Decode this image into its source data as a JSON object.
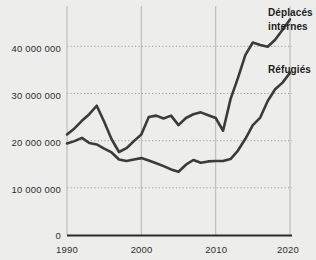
{
  "chart_data": {
    "type": "line",
    "title": "",
    "xlabel": "",
    "ylabel": "",
    "xlim": [
      1990,
      2020
    ],
    "ylim": [
      0,
      46000000
    ],
    "grid": "horizontal-dotted-and-vertical-solid",
    "legend_position": "right-inline-labels",
    "xticks": [
      "1990",
      "2000",
      "2010",
      "2020"
    ],
    "xtick_values": [
      1990,
      2000,
      2010,
      2020
    ],
    "yticks": [
      "0",
      "10 000 000",
      "20 000 000",
      "30 000 000",
      "40 000 000"
    ],
    "ytick_values": [
      0,
      10000000,
      20000000,
      30000000,
      40000000
    ],
    "x": [
      1990,
      1991,
      1992,
      1993,
      1994,
      1995,
      1996,
      1997,
      1998,
      1999,
      2000,
      2001,
      2002,
      2003,
      2004,
      2005,
      2006,
      2007,
      2008,
      2009,
      2010,
      2011,
      2012,
      2013,
      2014,
      2015,
      2016,
      2017,
      2018,
      2019,
      2020
    ],
    "series": [
      {
        "name": "Déplacés internes",
        "label_lines": [
          "Déplacés",
          "internes"
        ],
        "color": "#3b3b3b",
        "values": [
          21300000,
          22600000,
          24200000,
          25600000,
          27400000,
          24000000,
          20300000,
          17600000,
          18400000,
          19900000,
          21300000,
          25000000,
          25300000,
          24700000,
          25300000,
          23300000,
          24800000,
          25600000,
          26000000,
          25400000,
          24800000,
          22100000,
          28800000,
          33300000,
          38200000,
          40800000,
          40300000,
          39900000,
          41400000,
          43500000,
          45700000
        ]
      },
      {
        "name": "Réfugiés",
        "label_lines": [
          "Réfugiés"
        ],
        "color": "#3b3b3b",
        "values": [
          19400000,
          19900000,
          20600000,
          19500000,
          19200000,
          18300000,
          17500000,
          16000000,
          15700000,
          16000000,
          16300000,
          15800000,
          15200000,
          14600000,
          13900000,
          13400000,
          14900000,
          15900000,
          15300000,
          15600000,
          15700000,
          15700000,
          16100000,
          17900000,
          20400000,
          23300000,
          24900000,
          28400000,
          30900000,
          32300000,
          34400000
        ]
      }
    ]
  },
  "labels": {
    "ytick_40m": "40 000 000",
    "ytick_30m": "30 000 000",
    "ytick_20m": "20 000 000",
    "ytick_10m": "10 000 000",
    "ytick_0": "0",
    "xtick_1990": "1990",
    "xtick_2000": "2000",
    "xtick_2010": "2010",
    "xtick_2020": "2020",
    "series_idp_line1": "Déplacés",
    "series_idp_line2": "internes",
    "series_refugees": "Réfugiés"
  },
  "colors": {
    "background": "#ededeb",
    "line": "#3b3b3b",
    "axis": "#2b2b2b",
    "gridline_dotted": "#9a9a9a",
    "gridline_vertical": "#b6b6b6",
    "text": "#1d1d1d"
  }
}
